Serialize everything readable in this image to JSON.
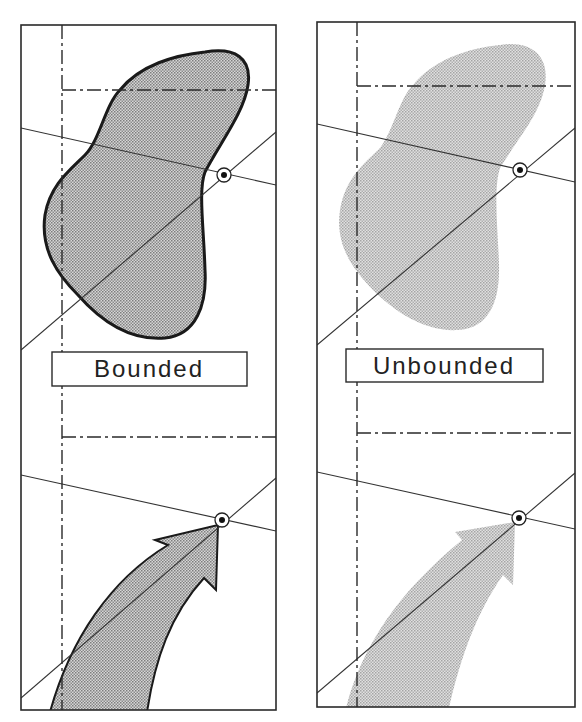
{
  "diagram": {
    "panels": [
      {
        "id": "bounded",
        "label": "Bounded",
        "region_style": "outlined",
        "fill_color": "#bdbdbd",
        "outline_color": "#1a1a1a"
      },
      {
        "id": "unbounded",
        "label": "Unbounded",
        "region_style": "no-outline",
        "fill_color": "#c8c8c8",
        "outline_color": null
      }
    ],
    "elements": {
      "target_marker": "circled-dot",
      "upper_shape": "blob",
      "lower_shape": "curved-arrow"
    },
    "colors": {
      "line": "#2a2a2a",
      "background": "#ffffff",
      "dot_pattern": "#8a8a8a"
    }
  }
}
